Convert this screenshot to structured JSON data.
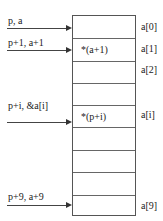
{
  "diagram": {
    "title": "",
    "cells": [
      {
        "content": "",
        "index_label": "a[0]"
      },
      {
        "content": "*(a+1)",
        "index_label": "a[1]"
      },
      {
        "content": "",
        "index_label": "a[2]"
      },
      {
        "content": "",
        "index_label": ""
      },
      {
        "content": "*(p+i)",
        "index_label": "a[i]"
      },
      {
        "content": "",
        "index_label": ""
      },
      {
        "content": "",
        "index_label": ""
      },
      {
        "content": "",
        "index_label": ""
      },
      {
        "content": "",
        "index_label": "a[9]"
      }
    ],
    "pointers": [
      {
        "label": "p, a",
        "points_to_cell": 0
      },
      {
        "label": "p+1, a+1",
        "points_to_cell": 1
      },
      {
        "label": "p+i, &a[i]",
        "points_to_cell": 4
      },
      {
        "label": "p+9, a+9",
        "points_to_cell": 8
      }
    ]
  }
}
